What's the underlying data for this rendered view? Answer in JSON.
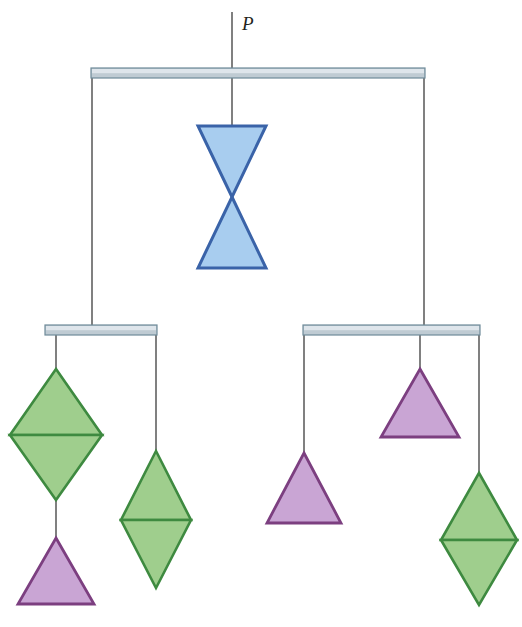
{
  "figure": {
    "background_color": "#ffffff",
    "width": 522,
    "height": 627
  },
  "labels": {
    "load": "P"
  },
  "palette": {
    "blue_fill": "#A8CDEF",
    "blue_stroke": "#3A63A8",
    "green_fill": "#9FCE8D",
    "green_stroke": "#3E8A40",
    "purple_fill": "#C9A5D4",
    "purple_stroke": "#7C3F80",
    "bar_fill": "#BFCBD3",
    "bar_highlight": "#E3EAEE",
    "bar_stroke": "#6E8A99",
    "string_stroke": "#4A4A4A",
    "label_color": "#231f20"
  },
  "bars": [
    {
      "name": "top-beam",
      "x1": 91,
      "x2": 425,
      "y": 68,
      "height": 10
    },
    {
      "name": "left-beam",
      "x1": 45,
      "x2": 157,
      "y": 325,
      "height": 10
    },
    {
      "name": "right-beam",
      "x1": 303,
      "x2": 480,
      "y": 325,
      "height": 10
    }
  ],
  "strings": [
    {
      "name": "load-string",
      "x": 232,
      "y1": 12,
      "y2": 73
    },
    {
      "name": "top-beam-to-bowtie",
      "x": 232,
      "y1": 73,
      "y2": 126
    },
    {
      "name": "top-beam-left-drop",
      "x": 92,
      "y1": 73,
      "y2": 326
    },
    {
      "name": "top-beam-right-drop",
      "x": 424,
      "y1": 73,
      "y2": 326
    },
    {
      "name": "left-beam-left-drop",
      "x": 56,
      "y1": 330,
      "y2": 369
    },
    {
      "name": "left-beam-right-drop",
      "x": 156,
      "y1": 330,
      "y2": 451
    },
    {
      "name": "green-diamond-to-triangle",
      "x": 56,
      "y1": 500,
      "y2": 538
    },
    {
      "name": "right-beam-left-drop",
      "x": 304,
      "y1": 330,
      "y2": 453
    },
    {
      "name": "right-beam-mid-drop",
      "x": 420,
      "y1": 330,
      "y2": 369
    },
    {
      "name": "right-beam-right-drop",
      "x": 479,
      "y1": 330,
      "y2": 473
    }
  ],
  "shapes": [
    {
      "name": "blue-bowtie",
      "type": "bowtie",
      "color": "blue",
      "cx": 232,
      "top": 126,
      "bottom": 268,
      "half_width": 34
    },
    {
      "name": "green-diamond-left",
      "type": "diamond",
      "color": "green",
      "cx": 56,
      "top": 369,
      "mid": 435,
      "bottom": 500,
      "half_width": 46
    },
    {
      "name": "purple-triangle-left-bottom",
      "type": "triangle-up",
      "color": "purple",
      "cx": 56,
      "top": 538,
      "bottom": 604,
      "half_width": 38
    },
    {
      "name": "green-diamond-left-inner",
      "type": "diamond",
      "color": "green",
      "cx": 156,
      "top": 451,
      "mid": 520,
      "bottom": 588,
      "half_width": 35
    },
    {
      "name": "purple-triangle-right-inner",
      "type": "triangle-up",
      "color": "purple",
      "cx": 304,
      "top": 453,
      "bottom": 523,
      "half_width": 37
    },
    {
      "name": "purple-triangle-right-upper",
      "type": "triangle-up",
      "color": "purple",
      "cx": 420,
      "top": 369,
      "bottom": 437,
      "half_width": 39
    },
    {
      "name": "green-diamond-right",
      "type": "diamond",
      "color": "green",
      "cx": 479,
      "top": 473,
      "mid": 540,
      "bottom": 605,
      "half_width": 38
    }
  ]
}
